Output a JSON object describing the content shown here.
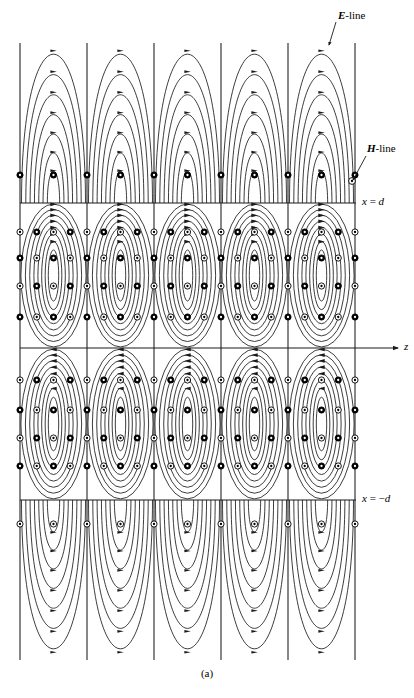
{
  "figure": {
    "caption": "(a)",
    "labels": {
      "e_line": "E-line",
      "h_line": "H-line",
      "x_upper": "x = d",
      "x_lower": "x = −d",
      "z_axis": "z"
    },
    "colors": {
      "line": "#1a1a1a",
      "background": "#ffffff",
      "marker_into_page": "#000000",
      "marker_out_of_page": "#ffffff"
    }
  },
  "chart_data": {
    "type": "line",
    "title": "",
    "xlabel": "z",
    "ylabel": "x",
    "grid": false,
    "legend": [
      "E-line",
      "H-line"
    ],
    "annotations": [
      {
        "text": "E-line",
        "x": 330,
        "y": 46,
        "target_x": 327,
        "target_y": 47
      },
      {
        "text": "H-line",
        "x": 366,
        "y": 150,
        "target_x": 350,
        "target_y": 180
      },
      {
        "text": "x = d",
        "x": 362,
        "y": 203
      },
      {
        "text": "x = −d",
        "x": 362,
        "y": 500
      },
      {
        "text": "z",
        "x": 404,
        "y": 348
      }
    ],
    "axis_ranges": {
      "z": [
        20,
        400
      ],
      "x": [
        43,
        660
      ]
    },
    "boundaries": {
      "x_equals_d_pixel_y": 203,
      "x_equals_minus_d_pixel_y": 500,
      "z_axis_pixel_y": 348,
      "plot_left_pixel_x": 20,
      "plot_right_pixel_x": 355,
      "plot_top_pixel_y": 43,
      "plot_bottom_pixel_y": 660
    },
    "period_pixels": 67,
    "cell_boundaries_pixel_x": [
      20,
      87,
      154,
      221,
      288,
      355
    ],
    "cells": 5,
    "regions": [
      {
        "name": "upper-outer",
        "x_range_pixel_y": [
          43,
          203
        ],
        "e_line_shape": "nested arches",
        "arrow_direction": "up",
        "loops_per_cell": 7
      },
      {
        "name": "upper-guide",
        "x_range_pixel_y": [
          203,
          348
        ],
        "e_line_shape": "nested closed loops",
        "arrow_direction": "clockwise",
        "loops_per_cell": 8
      },
      {
        "name": "lower-guide",
        "x_range_pixel_y": [
          348,
          500
        ],
        "e_line_shape": "nested closed loops",
        "arrow_direction": "counterclockwise",
        "loops_per_cell": 8
      },
      {
        "name": "lower-outer",
        "x_range_pixel_y": [
          500,
          660
        ],
        "e_line_shape": "nested arches",
        "arrow_direction": "down",
        "loops_per_cell": 7
      }
    ],
    "h_markers": {
      "into_page_symbol": "filled-circle",
      "out_of_page_symbol": "open-circle-with-dot",
      "description": "H-field directed normal to the page, alternating sign between adjacent half-cells"
    }
  }
}
